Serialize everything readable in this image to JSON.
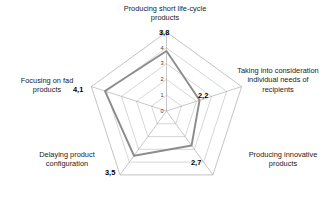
{
  "chart_data": {
    "type": "radar",
    "title": "",
    "categories": [
      "Producing short life-cycle products",
      "Taking into consideration individual needs of recipients",
      "Producing innovative products",
      "Delaying product configuration",
      "Focusing on fad products"
    ],
    "values": [
      3.8,
      2.2,
      2.7,
      3.5,
      4.1
    ],
    "value_labels": [
      "3,8",
      "2,2",
      "2,7",
      "3,5",
      "4,1"
    ],
    "tick_labels": [
      "0",
      "1",
      "2",
      "3",
      "4",
      "5"
    ],
    "ticks": [
      0,
      1,
      2,
      3,
      4,
      5
    ],
    "rlim": [
      0,
      5
    ],
    "grid": true,
    "legend": "none",
    "series": [
      {
        "name": "",
        "values": [
          3.8,
          2.2,
          2.7,
          3.5,
          4.1
        ],
        "color": "#8c8c8c"
      }
    ],
    "grid_color": "#b5b5b5",
    "axis_color": "#9a9a9a"
  },
  "axis_labels": {
    "top": "Producing short life-cycle\nproducts",
    "right": "Taking into consideration\nindividual needs of\nrecipients",
    "bottom_right": "Producing innovative\nproducts",
    "bottom_left": "Delaying product\nconfiguration",
    "left": "Focusing on fad\nproducts"
  },
  "value_labels": {
    "top": "3,8",
    "right": "2,2",
    "bottom_right": "2,7",
    "bottom_left": "3,5",
    "left": "4,1"
  },
  "tick_labels": {
    "t5": "5",
    "t4": "4",
    "t3": "3",
    "t2": "2",
    "t1": "1",
    "t0": "0"
  }
}
